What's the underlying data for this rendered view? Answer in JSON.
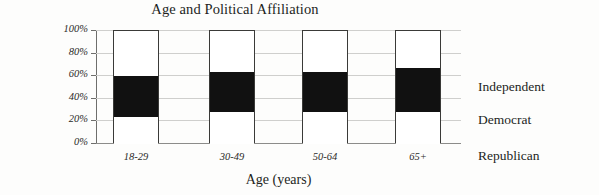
{
  "chart_data": {
    "type": "bar",
    "subtype": "stacked-100-percent",
    "title": "Age and Political Affiliation",
    "xlabel": "Age (years)",
    "ylabel": "Percent",
    "categories": [
      "18-29",
      "30-49",
      "50-64",
      "65+"
    ],
    "ylim": [
      0,
      100
    ],
    "ytick_labels": [
      "100%",
      "80%",
      "60%",
      "40%",
      "20%",
      "0%"
    ],
    "ytick_values": [
      100,
      80,
      60,
      40,
      20,
      0
    ],
    "grid": true,
    "grid_axis": "y",
    "legend_position": "right",
    "series": [
      {
        "name": "Independent",
        "color": "#ffffff",
        "values": [
          40,
          36,
          36,
          33
        ]
      },
      {
        "name": "Democrat",
        "color": "#111111",
        "values": [
          36,
          35,
          35,
          39
        ]
      },
      {
        "name": "Republican",
        "color": "#ffffff",
        "values": [
          24,
          29,
          29,
          28
        ]
      }
    ],
    "stack_order_bottom_to_top": [
      "Republican",
      "Democrat",
      "Independent"
    ],
    "stack_boundaries_percent": [
      {
        "category": "18-29",
        "republican_top": 24,
        "democrat_top": 60
      },
      {
        "category": "30-49",
        "republican_top": 29,
        "democrat_top": 64
      },
      {
        "category": "50-64",
        "republican_top": 29,
        "democrat_top": 64
      },
      {
        "category": "65+",
        "republican_top": 28,
        "democrat_top": 67
      }
    ]
  },
  "legend": {
    "entries": [
      {
        "label": "Independent",
        "top": 49
      },
      {
        "label": "Democrat",
        "top": 82
      },
      {
        "label": "Republican",
        "top": 118
      }
    ]
  },
  "colors": {
    "background": "#fdfdfc",
    "text": "#231f1d",
    "gridline": "#cfcfcd",
    "axis": "#6e6e6c",
    "bar_outline": "#3a3a38",
    "fill_dark": "#111111",
    "fill_light": "#ffffff"
  }
}
